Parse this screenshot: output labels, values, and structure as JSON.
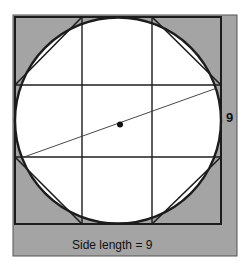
{
  "figure": {
    "side_label": "9",
    "caption": "Side length = 9",
    "colors": {
      "background_panel": "#a4a4a4",
      "circle_fill": "#ffffff",
      "stroke": "#1c1c1c",
      "text": "#111111"
    }
  }
}
